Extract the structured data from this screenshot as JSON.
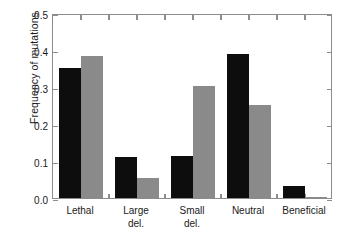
{
  "chart_data": {
    "type": "bar",
    "title": "",
    "subtitle": "",
    "xlabel": "",
    "ylabel": "Frequency of mutations",
    "categories": [
      "Lethal",
      "Large del.",
      "Small del.",
      "Neutral",
      "Beneficial"
    ],
    "category_lines": [
      [
        "Lethal"
      ],
      [
        "Large",
        "del."
      ],
      [
        "Small",
        "del."
      ],
      [
        "Neutral"
      ],
      [
        "Beneficial"
      ]
    ],
    "series": [
      {
        "name": "series-1",
        "color": "#0d0d0d",
        "values": [
          0.352,
          0.111,
          0.114,
          0.388,
          0.032
        ]
      },
      {
        "name": "series-2",
        "color": "#8a8a8a",
        "values": [
          0.384,
          0.054,
          0.304,
          0.251,
          0.004
        ]
      }
    ],
    "ylim": [
      0.0,
      0.5
    ],
    "ytick_values": [
      0.0,
      0.1,
      0.2,
      0.3,
      0.4,
      0.5
    ],
    "ytick_labels": [
      "0.0",
      "0.1",
      "0.2",
      "0.3",
      "0.4",
      "0.5"
    ],
    "grid": false,
    "legend": "none",
    "frame_color": "#8c8c8c",
    "background": "#ffffff"
  }
}
